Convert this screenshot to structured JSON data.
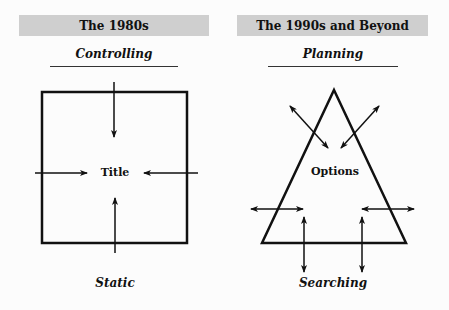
{
  "left": {
    "header": "The 1980s",
    "subtitle": "Controlling",
    "center_label": "Title",
    "bottom_label": "Static",
    "shape": "square",
    "arrows": "four arrows pointing inward to center"
  },
  "right": {
    "header": "The 1990s and Beyond",
    "subtitle": "Planning",
    "center_label": "Options",
    "bottom_label": "Searching",
    "shape": "triangle",
    "arrows": "six double-headed arrows crossing the edges"
  },
  "colors": {
    "header_bg": "#cfcfcf",
    "stroke": "#111111"
  }
}
